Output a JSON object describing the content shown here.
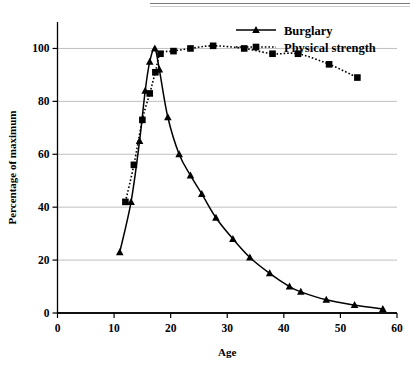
{
  "chart_data": {
    "type": "line",
    "title": "",
    "xlabel": "Age",
    "ylabel": "Percentage of maximum",
    "xlim": [
      0,
      60
    ],
    "ylim": [
      0,
      110
    ],
    "xticks": [
      0,
      10,
      20,
      30,
      40,
      50,
      60
    ],
    "yticks": [
      0,
      20,
      40,
      60,
      80,
      100
    ],
    "xtick_labels": [
      "0",
      "10",
      "20",
      "30",
      "40",
      "50",
      "60"
    ],
    "ytick_labels": [
      "0",
      "20",
      "40",
      "60",
      "80",
      "100"
    ],
    "grid": "horizontal",
    "legend_position": "top-right",
    "series": [
      {
        "name": "Burglary",
        "marker": "triangle",
        "linestyle": "solid",
        "color": "#000000",
        "points": [
          {
            "x": 11.0,
            "y": 23
          },
          {
            "x": 13.0,
            "y": 42
          },
          {
            "x": 14.5,
            "y": 65
          },
          {
            "x": 15.5,
            "y": 84
          },
          {
            "x": 16.3,
            "y": 95
          },
          {
            "x": 17.2,
            "y": 100
          },
          {
            "x": 18.0,
            "y": 92
          },
          {
            "x": 19.5,
            "y": 74
          },
          {
            "x": 21.5,
            "y": 60
          },
          {
            "x": 23.5,
            "y": 52
          },
          {
            "x": 25.5,
            "y": 45
          },
          {
            "x": 28.0,
            "y": 36
          },
          {
            "x": 31.0,
            "y": 28
          },
          {
            "x": 34.0,
            "y": 21
          },
          {
            "x": 37.5,
            "y": 15
          },
          {
            "x": 41.0,
            "y": 10
          },
          {
            "x": 43.0,
            "y": 8
          },
          {
            "x": 47.5,
            "y": 5
          },
          {
            "x": 52.5,
            "y": 3
          },
          {
            "x": 57.5,
            "y": 1.5
          }
        ]
      },
      {
        "name": "Physical strength",
        "marker": "square",
        "linestyle": "dotted",
        "color": "#000000",
        "points": [
          {
            "x": 12.0,
            "y": 42
          },
          {
            "x": 13.5,
            "y": 56
          },
          {
            "x": 15.0,
            "y": 73
          },
          {
            "x": 16.3,
            "y": 83
          },
          {
            "x": 17.3,
            "y": 91
          },
          {
            "x": 18.2,
            "y": 98
          },
          {
            "x": 20.5,
            "y": 99
          },
          {
            "x": 23.5,
            "y": 100
          },
          {
            "x": 27.5,
            "y": 101
          },
          {
            "x": 33.0,
            "y": 100
          },
          {
            "x": 38.0,
            "y": 98
          },
          {
            "x": 42.5,
            "y": 98
          },
          {
            "x": 48.0,
            "y": 94
          },
          {
            "x": 53.0,
            "y": 89
          }
        ]
      }
    ]
  },
  "legend": {
    "items": [
      {
        "label": "Burglary"
      },
      {
        "label": "Physical strength"
      }
    ]
  }
}
